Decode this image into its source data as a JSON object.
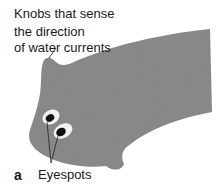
{
  "diagram": {
    "panel_label": "a",
    "labels": {
      "knobs_line1": "Knobs that sense",
      "knobs_line2": "the direction",
      "knobs_line3": "of water currents",
      "eyespots": "Eyespots"
    },
    "colors": {
      "body_fill": "#8c8c8c",
      "eyespot_ring": "#f2f2f2",
      "eyespot_center": "#111111",
      "leader_lines": "#222222"
    }
  }
}
